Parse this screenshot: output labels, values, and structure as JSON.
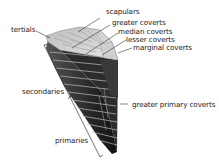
{
  "diagram": {
    "labels": {
      "scapulars": "scapulars",
      "greater_coverts": "greater coverts",
      "median_coverts": "median coverts",
      "lesser_coverts": "lesser coverts",
      "marginal_coverts": "marginal coverts",
      "tertials": "tertials",
      "secondaries": "secondaries",
      "greater_primary_coverts": "greater primary coverts",
      "primaries": "primaries"
    },
    "colors": {
      "text": "#222222",
      "leader": "#333333",
      "feather_dark": "#1a1a1a",
      "feather_light": "#d8d8d8"
    }
  }
}
